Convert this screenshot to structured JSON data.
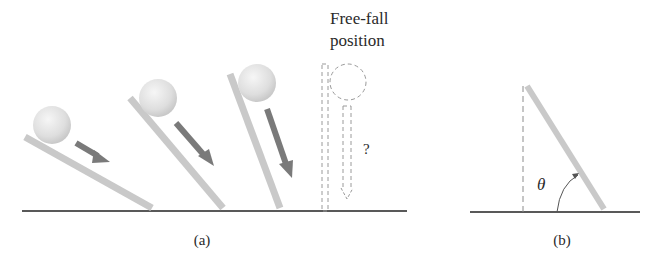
{
  "figure": {
    "panel_a": {
      "caption": "(a)",
      "free_fall_label_line1": "Free-fall",
      "free_fall_label_line2": "position",
      "question_mark": "?",
      "boards": [
        {
          "name": "low-angle",
          "angle_deg": 28
        },
        {
          "name": "medium-angle",
          "angle_deg": 50
        },
        {
          "name": "steep-angle",
          "angle_deg": 72
        }
      ],
      "free_fall_board_angle_deg": 90
    },
    "panel_b": {
      "caption": "(b)",
      "angle_symbol": "θ"
    },
    "colors": {
      "board": "#c8c8c8",
      "board_edge": "#b4b4b4",
      "ball_light": "#f4f4f4",
      "ball_dark": "#cfcfcf",
      "arrow": "#7a7a7a",
      "ground": "#222222",
      "dashed": "#9a9a9a",
      "text": "#2a2a2a"
    }
  }
}
